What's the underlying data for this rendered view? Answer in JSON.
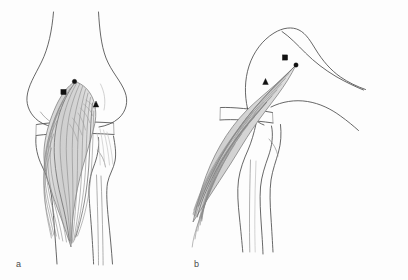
{
  "figure": {
    "background_color": "#fdfdfd",
    "ink_color": "#4b4b4b",
    "muscle_fill_color": "#d8d8d8",
    "marker_color": "#111111",
    "width": 408,
    "height": 280
  },
  "panels": [
    {
      "id": "a",
      "label": "a",
      "view_name": "anterior-view",
      "description": "Anterior view of knee with medial gastrocnemius muscle flap elevated",
      "structures": [
        {
          "name": "distal-femur",
          "kind": "bone"
        },
        {
          "name": "femoral-condyles",
          "kind": "bone"
        },
        {
          "name": "patella",
          "kind": "bone"
        },
        {
          "name": "proximal-tibia",
          "kind": "bone"
        },
        {
          "name": "fibula",
          "kind": "bone"
        },
        {
          "name": "gastrocnemius-muscle-flap",
          "kind": "muscle"
        },
        {
          "name": "tendon-fibers",
          "kind": "tendon"
        }
      ],
      "markers": [
        {
          "id": "a-circle",
          "shape": "circle",
          "x": 74.5,
          "y": 81.5,
          "size": 4.4,
          "landmark": "proximal-origin-point"
        },
        {
          "id": "a-square",
          "shape": "square",
          "x": 63.5,
          "y": 92.0,
          "size": 5.2,
          "landmark": "vascular-pedicle-point"
        },
        {
          "id": "a-triangle",
          "shape": "triangle",
          "x": 96.0,
          "y": 104.0,
          "size": 5.6,
          "landmark": "distal-insertion-point"
        }
      ]
    },
    {
      "id": "b",
      "label": "b",
      "view_name": "lateral-view",
      "description": "Lateral view of flexed knee with muscle flap rotated over defect",
      "structures": [
        {
          "name": "distal-femur",
          "kind": "bone"
        },
        {
          "name": "femoral-condyle",
          "kind": "bone"
        },
        {
          "name": "patella",
          "kind": "bone"
        },
        {
          "name": "proximal-tibia",
          "kind": "bone"
        },
        {
          "name": "fibula",
          "kind": "bone"
        },
        {
          "name": "gastrocnemius-muscle-flap",
          "kind": "muscle"
        }
      ],
      "markers": [
        {
          "id": "b-square",
          "shape": "square",
          "x": 285.0,
          "y": 57.5,
          "size": 5.2,
          "landmark": "vascular-pedicle-point"
        },
        {
          "id": "b-circle",
          "shape": "circle",
          "x": 296.0,
          "y": 65.0,
          "size": 4.4,
          "landmark": "proximal-origin-point"
        },
        {
          "id": "b-triangle",
          "shape": "triangle",
          "x": 265.5,
          "y": 81.5,
          "size": 5.6,
          "landmark": "distal-insertion-point"
        }
      ]
    }
  ],
  "legend": {
    "circle_meaning": "proximal-origin-point",
    "square_meaning": "vascular-pedicle-point",
    "triangle_meaning": "distal-insertion-point"
  }
}
